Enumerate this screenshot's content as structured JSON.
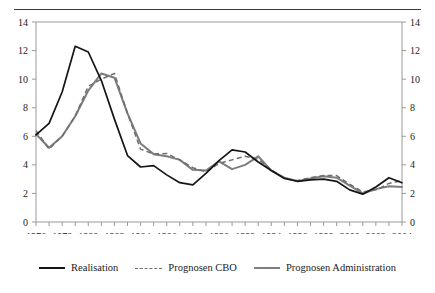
{
  "chart_data": {
    "type": "line",
    "title": "",
    "subtitle": "",
    "xlabel": "",
    "ylabel": "",
    "xlim": [
      1976,
      2004
    ],
    "ylim": [
      0,
      14
    ],
    "grid": false,
    "legend_position": "bottom",
    "y_ticks": [
      0,
      2,
      4,
      6,
      8,
      10,
      12,
      14
    ],
    "y_axis_right_mirrored": true,
    "x_ticks_labeled": [
      1976,
      1978,
      1980,
      1982,
      1984,
      1986,
      1988,
      1990,
      1992,
      1994,
      1996,
      1998,
      2000,
      2002,
      2004
    ],
    "x_tick_interval_minor": 1,
    "x": [
      1976,
      1977,
      1978,
      1979,
      1980,
      1981,
      1982,
      1983,
      1984,
      1985,
      1986,
      1987,
      1988,
      1989,
      1990,
      1991,
      1992,
      1993,
      1994,
      1995,
      1996,
      1997,
      1998,
      1999,
      2000,
      2001,
      2002,
      2003,
      2004
    ],
    "series": [
      {
        "name": "Realisation",
        "style": "solid",
        "color": "#151515",
        "values": [
          6.1,
          6.9,
          9.1,
          12.3,
          11.9,
          9.9,
          7.2,
          4.65,
          3.85,
          3.95,
          3.3,
          2.75,
          2.6,
          3.4,
          4.3,
          5.05,
          4.9,
          4.2,
          3.6,
          3.05,
          2.85,
          2.95,
          3.0,
          2.85,
          2.25,
          1.95,
          2.45,
          3.1,
          2.75
        ]
      },
      {
        "name": "Prognosen CBO",
        "style": "dashed",
        "color": "#6f6f6f",
        "values": [
          6.4,
          5.1,
          6.0,
          7.4,
          9.5,
          10.0,
          10.4,
          7.6,
          5.1,
          4.75,
          4.8,
          4.35,
          3.8,
          3.5,
          4.1,
          4.35,
          4.6,
          4.4,
          3.65,
          3.05,
          2.9,
          3.1,
          3.25,
          3.25,
          2.65,
          2.1,
          2.25,
          2.7,
          2.9
        ]
      },
      {
        "name": "Prognosen Administration",
        "style": "solid",
        "color": "#7d7d7d",
        "values": [
          6.15,
          5.2,
          6.0,
          7.4,
          9.2,
          10.4,
          10.1,
          7.6,
          5.5,
          4.75,
          4.6,
          4.35,
          3.65,
          3.6,
          4.25,
          3.7,
          4.0,
          4.6,
          3.6,
          3.1,
          2.85,
          3.05,
          3.2,
          3.1,
          2.55,
          2.0,
          2.3,
          2.5,
          2.45
        ]
      }
    ]
  },
  "legend": {
    "items": [
      {
        "label": "Realisation",
        "swatch": "solid-black-line-icon"
      },
      {
        "label": "Prognosen CBO",
        "swatch": "dashed-gray-line-icon"
      },
      {
        "label": "Prognosen Administration",
        "swatch": "solid-gray-line-icon"
      }
    ]
  }
}
